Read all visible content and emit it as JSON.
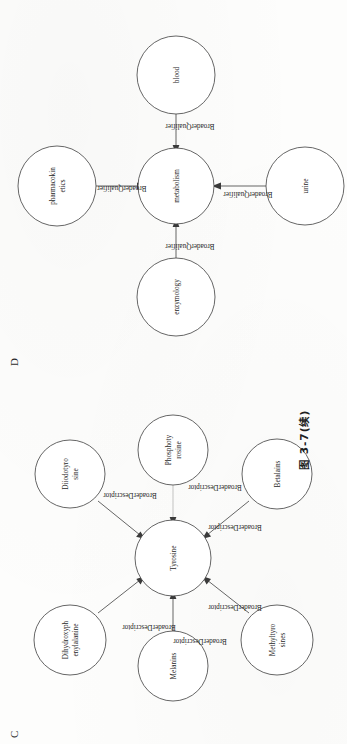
{
  "page": {
    "caption": "图 3-7(续)",
    "background_color": "#fdfdfc",
    "ink_color": "#4a4a4a"
  },
  "panel_d": {
    "letter": "D",
    "center_node": "metabolism",
    "nodes": [
      {
        "id": "pharmacokinetics",
        "lines": [
          "pharmacokin",
          "etics"
        ]
      },
      {
        "id": "enzymology",
        "lines": [
          "enzymology"
        ]
      },
      {
        "id": "metabolism",
        "lines": [
          "metabolism"
        ]
      },
      {
        "id": "blood",
        "lines": [
          "blood"
        ]
      },
      {
        "id": "urine",
        "lines": [
          "urine"
        ]
      }
    ],
    "edges": [
      {
        "from": "pharmacokinetics",
        "to": "metabolism",
        "label": "BroaderQualifier"
      },
      {
        "from": "enzymology",
        "to": "metabolism",
        "label": "BroaderQualifier"
      },
      {
        "from": "blood",
        "to": "metabolism",
        "label": "BroaderQualifier"
      },
      {
        "from": "urine",
        "to": "metabolism",
        "label": "BroaderQualifier"
      }
    ]
  },
  "panel_c": {
    "letter": "C",
    "center_node": "Tyrosine",
    "nodes": [
      {
        "id": "dihydroxyphenylalanine",
        "lines": [
          "Dihydroxyph",
          "enylalanine"
        ]
      },
      {
        "id": "diiodotyrosine",
        "lines": [
          "Diiodotyro",
          "sine"
        ]
      },
      {
        "id": "melanins",
        "lines": [
          "Melanins"
        ]
      },
      {
        "id": "tyrosine",
        "lines": [
          "Tyrosine"
        ]
      },
      {
        "id": "phosphotyrosine",
        "lines": [
          "Phosphoty",
          "rosine"
        ]
      },
      {
        "id": "methyltyrosines",
        "lines": [
          "Methyltyro",
          "sines"
        ]
      },
      {
        "id": "betalains",
        "lines": [
          "Betalains"
        ]
      }
    ],
    "edges": [
      {
        "from": "dihydroxyphenylalanine",
        "to": "tyrosine",
        "label": "BroaderDescriptor"
      },
      {
        "from": "diiodotyrosine",
        "to": "tyrosine",
        "label": "BroaderDescriptor"
      },
      {
        "from": "melanins",
        "to": "tyrosine",
        "label": "BroaderDescriptor"
      },
      {
        "from": "phosphotyrosine",
        "to": "tyrosine",
        "label": "BroaderDescriptor"
      },
      {
        "from": "methyltyrosines",
        "to": "tyrosine",
        "label": "BroaderDescriptor"
      },
      {
        "from": "betalains",
        "to": "tyrosine",
        "label": "BroaderDescriptor"
      }
    ]
  }
}
